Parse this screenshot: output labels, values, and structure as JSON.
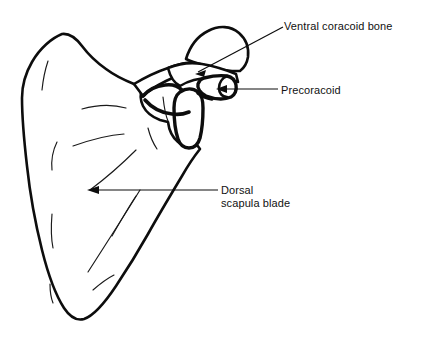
{
  "figure": {
    "kind": "anatomical-line-drawing",
    "background_color": "#ffffff",
    "ink_color": "#0d0d0d",
    "width": 431,
    "height": 343
  },
  "labels": [
    {
      "id": "ventral-coracoid-bone",
      "text": "Ventral coracoid bone",
      "lines": [
        "Ventral coracoid bone"
      ],
      "leader_type": "diagonal-arrow",
      "arrow_target": "upper rounded coracoid lobe"
    },
    {
      "id": "precoracoid",
      "text": "Precoracoid",
      "lines": [
        "Precoracoid"
      ],
      "leader_type": "horizontal-arrow",
      "arrow_target": "cylindrical tube with cut elliptical end"
    },
    {
      "id": "dorsal-scapula-blade",
      "text": "Dorsal\nscapula blade",
      "lines": [
        "Dorsal",
        "scapula blade"
      ],
      "leader_type": "horizontal-arrow",
      "arrow_target": "broad flat blade body"
    }
  ]
}
